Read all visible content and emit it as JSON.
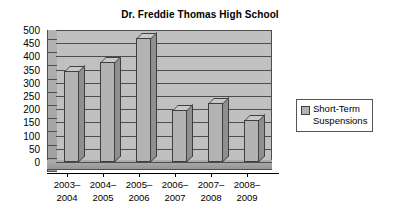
{
  "chart_data": {
    "type": "bar",
    "title": "Dr. Freddie Thomas High School",
    "xlabel": "",
    "ylabel": "",
    "ylim": [
      0,
      500
    ],
    "ytick_step": 50,
    "yticks": [
      500,
      450,
      400,
      350,
      300,
      250,
      200,
      150,
      100,
      50,
      0
    ],
    "grid": true,
    "legend_position": "right",
    "categories": [
      "2003–\n2004",
      "2004–\n2005",
      "2005–\n2006",
      "2006–\n2007",
      "2007–\n2008",
      "2008–\n2009"
    ],
    "category_lines": [
      [
        "2003–",
        "2004"
      ],
      [
        "2004–",
        "2005"
      ],
      [
        "2005–",
        "2006"
      ],
      [
        "2006–",
        "2007"
      ],
      [
        "2007–",
        "2008"
      ],
      [
        "2008–",
        "2009"
      ]
    ],
    "series": [
      {
        "name": "Short-Term Suspensions",
        "name_lines": [
          "Short-Term",
          "Suspensions"
        ],
        "color": "#b3b3b3",
        "values": [
          345,
          380,
          470,
          198,
          225,
          158
        ]
      }
    ]
  },
  "colors": {
    "bar_front": "#b3b3b3",
    "bar_top": "#c8c8c8",
    "bar_side": "#8f8f8f",
    "plot_background": "#c0c0c0",
    "wall_side": "#a9a9a9",
    "floor": "#a0a0a0",
    "gridline": "#4d4d4d",
    "text": "#000000",
    "page_background": "#ffffff"
  }
}
